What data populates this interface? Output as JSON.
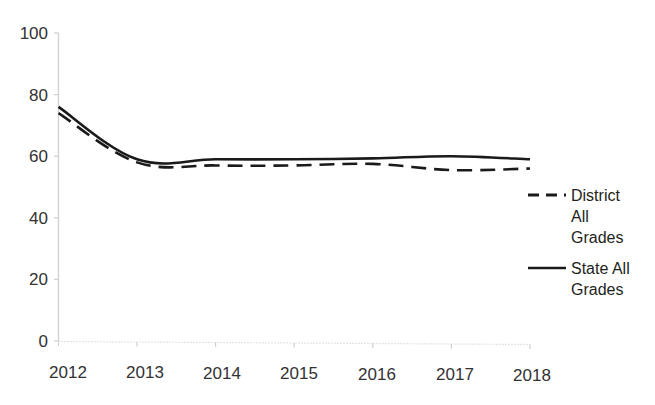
{
  "chart_data": {
    "type": "line",
    "title": "",
    "xlabel": "",
    "ylabel": "",
    "categories": [
      "2012",
      "2013",
      "2014",
      "2015",
      "2016",
      "2017",
      "2018"
    ],
    "x": [
      2012,
      2013,
      2014,
      2015,
      2016,
      2017,
      2018
    ],
    "xlim": [
      2012,
      2018
    ],
    "ylim": [
      0,
      100
    ],
    "yticks": [
      0,
      20,
      40,
      60,
      80,
      100
    ],
    "ytick_labels": [
      "0",
      "20",
      "40",
      "60",
      "80",
      "100"
    ],
    "xtick_labels": [
      "2012",
      "2013",
      "2014",
      "2015",
      "2016",
      "2017",
      "2018"
    ],
    "grid": false,
    "legend_position": "right",
    "series": [
      {
        "name": "District All Grades",
        "style": "dashed",
        "color": "#1a1a1a",
        "values": [
          74,
          58,
          57,
          57,
          57.5,
          55.5,
          56
        ]
      },
      {
        "name": "State All Grades",
        "style": "solid",
        "color": "#1a1a1a",
        "values": [
          76,
          59,
          59,
          59,
          59.3,
          60,
          59
        ]
      }
    ]
  },
  "axes": {
    "y_ticks": [
      {
        "label": "100",
        "value": 100
      },
      {
        "label": "80",
        "value": 80
      },
      {
        "label": "60",
        "value": 60
      },
      {
        "label": "40",
        "value": 40
      },
      {
        "label": "20",
        "value": 20
      },
      {
        "label": "0",
        "value": 0
      }
    ],
    "x_ticks": [
      {
        "label": "2012",
        "value": 2012
      },
      {
        "label": "2013",
        "value": 2013
      },
      {
        "label": "2014",
        "value": 2014
      },
      {
        "label": "2015",
        "value": 2015
      },
      {
        "label": "2016",
        "value": 2016
      },
      {
        "label": "2017",
        "value": 2017
      },
      {
        "label": "2018",
        "value": 2018
      }
    ]
  },
  "legend": {
    "entries": [
      {
        "style": "dashed",
        "lines": [
          "District",
          "All",
          "Grades"
        ],
        "line1": "District",
        "line2": "All",
        "line3": "Grades"
      },
      {
        "style": "solid",
        "lines": [
          "State All",
          "Grades"
        ],
        "line1": "State All",
        "line2": "Grades"
      }
    ]
  }
}
